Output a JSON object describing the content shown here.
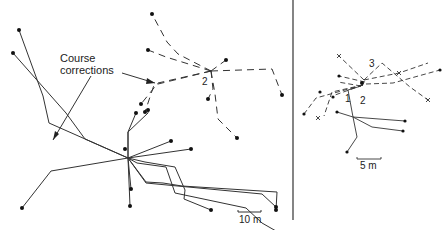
{
  "left_panel": {
    "annotation": {
      "line1": "Course",
      "line2": "corrections"
    },
    "release_label": "2",
    "scale_bar": {
      "label": "10 m"
    }
  },
  "right_panel": {
    "labels": {
      "one": "1",
      "two": "2",
      "three": "3"
    },
    "scale_bar": {
      "label": "5 m"
    }
  },
  "colors": {
    "ink": "#222222",
    "background": "#ffffff"
  }
}
